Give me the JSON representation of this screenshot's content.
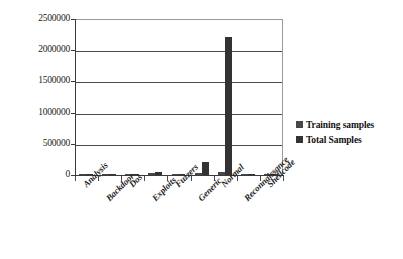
{
  "chart_data": {
    "type": "bar",
    "title": "",
    "xlabel": "",
    "ylabel": "",
    "ylim": [
      0,
      2500000
    ],
    "grid": true,
    "legend_position": "right",
    "categories": [
      "Analysis",
      "Backdoor",
      "Dos",
      "Exploits",
      "Fuzzers",
      "Generic",
      "Normal",
      "Reconnaissance",
      "Shellcode"
    ],
    "ytick_labels": [
      "2500000",
      "2000000",
      "1500000",
      "1000000",
      "500000",
      "0"
    ],
    "ytick_values": [
      2500000,
      2000000,
      1500000,
      1000000,
      500000,
      0
    ],
    "series": [
      {
        "name": "Training samples",
        "color": "#474747",
        "values": [
          2000,
          1746,
          12264,
          33393,
          18184,
          40000,
          56000,
          10491,
          1133
        ]
      },
      {
        "name": "Total Samples",
        "color": "#333333",
        "values": [
          2677,
          2329,
          16353,
          44525,
          24246,
          215481,
          2218761,
          13987,
          1511
        ]
      }
    ]
  },
  "legend": {
    "items": [
      {
        "label": "Training samples",
        "color": "#474747"
      },
      {
        "label": "Total Samples",
        "color": "#333333"
      }
    ]
  }
}
